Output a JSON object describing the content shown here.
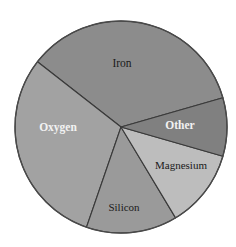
{
  "chart_data": {
    "type": "pie",
    "title": "",
    "subtitle": "",
    "xlabel": "",
    "ylabel": "",
    "legend_position": "none",
    "grid": false,
    "labels_inside": true,
    "categories": [
      "Iron",
      "Oxygen",
      "Silicon",
      "Magnesium",
      "Other"
    ],
    "values": [
      35,
      30,
      14,
      12,
      9
    ],
    "units": "percent",
    "slices": [
      {
        "label": "Iron",
        "value": 35,
        "percent": 35,
        "angle_deg": 126,
        "start_angle_deg": 16,
        "end_angle_deg": 142,
        "color": "#8c8c8c",
        "label_color": "#1a1a1a",
        "label_weight": "normal",
        "label_x": 122,
        "label_y": 64,
        "label_size": 11.5
      },
      {
        "label": "Oxygen",
        "value": 30,
        "percent": 30,
        "angle_deg": 109,
        "start_angle_deg": 142,
        "end_angle_deg": 251,
        "color": "#a2a2a2",
        "label_color": "#f2f2f2",
        "label_weight": "bold",
        "label_x": 58,
        "label_y": 128,
        "label_size": 11.5
      },
      {
        "label": "Silicon",
        "value": 14,
        "percent": 14,
        "angle_deg": 50,
        "start_angle_deg": 251,
        "end_angle_deg": 301,
        "color": "#9a9a9a",
        "label_color": "#1a1a1a",
        "label_weight": "normal",
        "label_x": 124,
        "label_y": 208,
        "label_size": 11
      },
      {
        "label": "Magnesium",
        "value": 12,
        "percent": 12,
        "angle_deg": 43,
        "start_angle_deg": 301,
        "end_angle_deg": 344,
        "color": "#bdbdbd",
        "label_color": "#1a1a1a",
        "label_weight": "normal",
        "label_x": 181,
        "label_y": 166,
        "label_size": 11
      },
      {
        "label": "Other",
        "value": 9,
        "percent": 9,
        "angle_deg": 32,
        "start_angle_deg": 344,
        "end_angle_deg": 376,
        "color": "#808080",
        "label_color": "#f2f2f2",
        "label_weight": "bold",
        "label_x": 180,
        "label_y": 126,
        "label_size": 11.5
      }
    ],
    "geometry": {
      "center_x": 121,
      "center_y": 127,
      "radius": 106
    },
    "background_color": "#ffffff",
    "border_color": "#3a3a3a"
  }
}
